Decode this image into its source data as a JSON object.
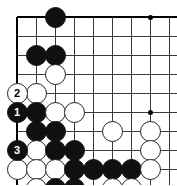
{
  "diagram": {
    "caption": "2 도",
    "caption_x": 128,
    "caption_y": 160,
    "board": {
      "origin_x": 17,
      "origin_y": 17,
      "spacing": 19,
      "cols": 9,
      "rows": 9,
      "left_edge": true,
      "top_edge": true,
      "bottom_edge": true,
      "right_edge": false,
      "line_color": "#3a3a3a",
      "edge_color": "#000000",
      "board_color": "#ffffff"
    },
    "star_points": [
      {
        "col": 7,
        "row": 0
      },
      {
        "col": 7,
        "row": 5
      }
    ],
    "stones": [
      {
        "col": 2,
        "row": 0,
        "color": "black",
        "label": ""
      },
      {
        "col": 1,
        "row": 2,
        "color": "black",
        "label": ""
      },
      {
        "col": 2,
        "row": 2,
        "color": "black",
        "label": ""
      },
      {
        "col": 2,
        "row": 3,
        "color": "white",
        "label": ""
      },
      {
        "col": 0,
        "row": 4,
        "color": "white",
        "label": "2"
      },
      {
        "col": 1,
        "row": 4,
        "color": "white",
        "label": ""
      },
      {
        "col": 0,
        "row": 5,
        "color": "black",
        "label": "1"
      },
      {
        "col": 1,
        "row": 5,
        "color": "black",
        "label": ""
      },
      {
        "col": 2,
        "row": 5,
        "color": "white",
        "label": ""
      },
      {
        "col": 3,
        "row": 5,
        "color": "white",
        "label": ""
      },
      {
        "col": 1,
        "row": 6,
        "color": "black",
        "label": ""
      },
      {
        "col": 2,
        "row": 6,
        "color": "black",
        "label": ""
      },
      {
        "col": 5,
        "row": 6,
        "color": "white",
        "label": ""
      },
      {
        "col": 7,
        "row": 6,
        "color": "white",
        "label": ""
      },
      {
        "col": 0,
        "row": 7,
        "color": "black",
        "label": "3"
      },
      {
        "col": 1,
        "row": 7,
        "color": "white",
        "label": ""
      },
      {
        "col": 2,
        "row": 7,
        "color": "black",
        "label": ""
      },
      {
        "col": 3,
        "row": 7,
        "color": "black",
        "label": ""
      },
      {
        "col": 7,
        "row": 7,
        "color": "white",
        "label": ""
      },
      {
        "col": 0,
        "row": 8,
        "color": "white",
        "label": ""
      },
      {
        "col": 1,
        "row": 8,
        "color": "white",
        "label": ""
      },
      {
        "col": 2,
        "row": 8,
        "color": "white",
        "label": ""
      },
      {
        "col": 3,
        "row": 8,
        "color": "black",
        "label": ""
      },
      {
        "col": 4,
        "row": 8,
        "color": "black",
        "label": ""
      },
      {
        "col": 5,
        "row": 8,
        "color": "black",
        "label": ""
      },
      {
        "col": 6,
        "row": 8,
        "color": "black",
        "label": ""
      },
      {
        "col": 7,
        "row": 8,
        "color": "white",
        "label": ""
      },
      {
        "col": 1,
        "row": 9,
        "color": "white",
        "label": ""
      },
      {
        "col": 2,
        "row": 9,
        "color": "black",
        "label": ""
      },
      {
        "col": 3,
        "row": 9,
        "color": "black",
        "label": ""
      },
      {
        "col": 5,
        "row": 9,
        "color": "white",
        "label": ""
      },
      {
        "col": 6,
        "row": 9,
        "color": "white",
        "label": ""
      }
    ]
  }
}
